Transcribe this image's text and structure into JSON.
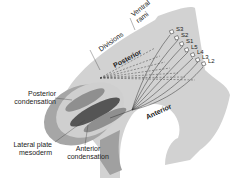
{
  "diagram": {
    "type": "anatomical-illustration",
    "labels": {
      "ventral_rami": "Ventral rami",
      "ventral_rami_line1": "Ventral",
      "ventral_rami_line2": "rami",
      "divisions": "Divisions",
      "posterior": "Posterior",
      "anterior": "Anterior",
      "posterior_condensation_line1": "Posterior",
      "posterior_condensation_line2": "condensation",
      "lateral_plate_line1": "Lateral plate",
      "lateral_plate_line2": "mesoderm",
      "anterior_condensation_line1": "Anterior",
      "anterior_condensation_line2": "condensation"
    },
    "nerve_roots": [
      "S3",
      "S2",
      "S1",
      "L5",
      "L4",
      "L3",
      "L2"
    ],
    "colors": {
      "body": "#d4d4d4",
      "limb_outer": "#a8a8a8",
      "limb_inner": "#c8c8c8",
      "mesoderm": "#5a5a5a",
      "condensation": "#8a8a8a",
      "lines": "#333333"
    }
  }
}
